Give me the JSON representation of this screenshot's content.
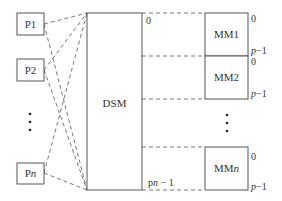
{
  "diagram": {
    "processors": [
      {
        "label": "P1"
      },
      {
        "label": "P2"
      },
      {
        "label": "Pn"
      }
    ],
    "processor_ellipsis": "⋮",
    "dsm": {
      "label": "DSM",
      "start_address": "0",
      "end_address": "pn − 1"
    },
    "memory_modules": [
      {
        "label": "MM1",
        "start": "0",
        "end": "p−1"
      },
      {
        "label": "MM2",
        "start": "0",
        "end": "p−1"
      },
      {
        "label": "MMn",
        "start": "0",
        "end": "p−1"
      }
    ],
    "memory_ellipsis": "⋮"
  }
}
